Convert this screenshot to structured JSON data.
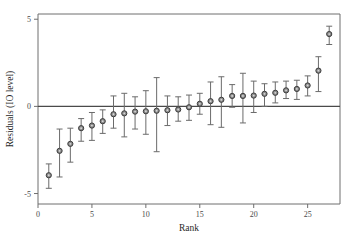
{
  "chart_data": {
    "type": "scatter",
    "title": "",
    "xlabel": "Rank",
    "ylabel": "Residuals (IO level)",
    "grid": false,
    "legend": null,
    "xlim": [
      0,
      28
    ],
    "ylim": [
      -5.6,
      5.3
    ],
    "xticks": [
      0,
      5,
      10,
      15,
      20,
      25
    ],
    "yticks": [
      -5,
      0,
      5
    ],
    "xtick_labels": [
      "0",
      "5",
      "10",
      "15",
      "20",
      "25"
    ],
    "ytick_labels": [
      "-5",
      "0",
      "5"
    ],
    "reference_lines": [
      {
        "axis": "y",
        "value": 0
      }
    ],
    "error_bar_style": "capped-vertical",
    "marker_style": "circle-open-gray",
    "x": [
      1,
      2,
      3,
      4,
      5,
      6,
      7,
      8,
      9,
      10,
      11,
      12,
      13,
      14,
      15,
      16,
      17,
      18,
      19,
      20,
      21,
      22,
      23,
      24,
      25,
      26,
      27
    ],
    "values": [
      -3.95,
      -2.55,
      -2.15,
      -1.25,
      -1.1,
      -0.85,
      -0.45,
      -0.4,
      -0.3,
      -0.28,
      -0.25,
      -0.22,
      -0.18,
      -0.05,
      0.15,
      0.3,
      0.38,
      0.6,
      0.6,
      0.62,
      0.72,
      0.78,
      0.92,
      1.0,
      1.2,
      2.05,
      4.15
    ],
    "y_lower": [
      -4.7,
      -4.05,
      -3.2,
      -2.0,
      -1.95,
      -1.55,
      -1.25,
      -1.75,
      -1.3,
      -1.6,
      -2.6,
      -1.1,
      -0.85,
      -0.8,
      -0.45,
      -1.05,
      -1.2,
      -0.05,
      -0.95,
      -0.35,
      0.0,
      0.2,
      0.45,
      0.4,
      0.6,
      0.85,
      3.55
    ],
    "y_upper": [
      -3.3,
      -1.3,
      -1.25,
      -0.7,
      -0.35,
      -0.2,
      0.6,
      0.75,
      0.55,
      0.9,
      1.65,
      0.6,
      0.55,
      0.65,
      0.75,
      1.4,
      1.7,
      1.25,
      1.9,
      1.45,
      1.3,
      1.4,
      1.45,
      1.5,
      1.75,
      2.85,
      4.6
    ],
    "n_points": 27,
    "colors": {
      "marker_fill": "#8d8d8d",
      "marker_edge": "#3c3c3c",
      "error_bar": "#6b6b6b",
      "axis": "#6e6e6e",
      "zero_line": "#4a4a4a",
      "background": "#ffffff",
      "text": "#2a2a2a"
    }
  }
}
